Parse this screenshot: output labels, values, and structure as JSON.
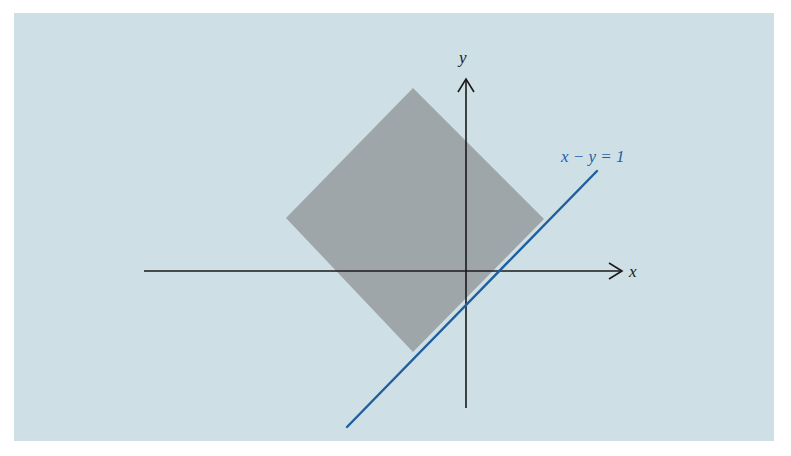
{
  "diagram": {
    "background_color": "#cfdfe6",
    "region_color": "#9ea6aa",
    "axis_color": "#1a1a1a",
    "line_color": "#1f5f9e",
    "label_color_axis": "#1a1a1a",
    "label_color_line": "#1f5f9e",
    "x_axis_label": "x",
    "y_axis_label": "y",
    "line_label": "x − y = 1",
    "region_shape": "square rotated 45° (diamond)",
    "region_vertices_units": {
      "top": [
        -1.6,
        5.5
      ],
      "right": [
        2.3,
        1.5
      ],
      "bottom": [
        -1.6,
        -2.5
      ],
      "left": [
        -5.5,
        1.6
      ]
    }
  }
}
